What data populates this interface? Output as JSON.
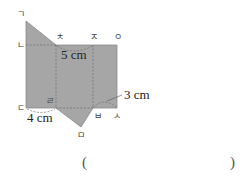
{
  "diagram": {
    "type": "triangular-prism-net",
    "fill_color": "#a6a6a6",
    "edge_color": "#7a7a7a",
    "vertex_labels": {
      "g": "ㄱ",
      "n": "ㄴ",
      "d": "ㄷ",
      "r": "ㄹ",
      "m": "ㅁ",
      "b": "ㅂ",
      "s": "ㅅ",
      "o": "ㅇ",
      "j": "ㅈ",
      "ch": "ㅊ"
    },
    "measurements": {
      "top_edge": "5 cm",
      "bottom_left_edge": "4 cm",
      "right_arc": "3 cm"
    }
  },
  "answer": {
    "open_paren": "(",
    "close_paren": ")",
    "value": ""
  }
}
